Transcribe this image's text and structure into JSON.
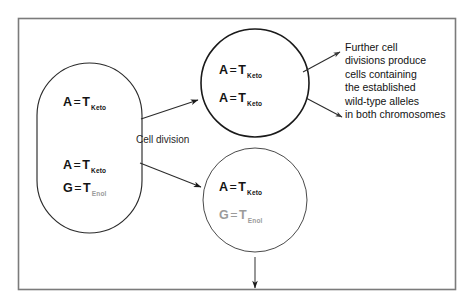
{
  "figure": {
    "border_color": "#7a7a7a",
    "stroke_color": "#1a1a1a",
    "gray_color": "#9b9b9b",
    "background": "#ffffff"
  },
  "parent_cell": {
    "name": "parent-cell",
    "shape": "stadium",
    "top_pair": {
      "left_base": "A",
      "equals": "=",
      "right_base": "T",
      "subscript": "Keto",
      "style": "dark"
    },
    "bottom_pairs": [
      {
        "left_base": "A",
        "equals": "=",
        "right_base": "T",
        "subscript": "Keto",
        "style": "dark"
      },
      {
        "left_base": "G",
        "equals": "=",
        "right_base": "T",
        "subscript": "Enol",
        "style": "dark-with-gray-subscript"
      }
    ]
  },
  "daughter_cell_top": {
    "name": "daughter-cell-top",
    "shape": "circle",
    "pairs": [
      {
        "left_base": "A",
        "equals": "=",
        "right_base": "T",
        "subscript": "Keto",
        "style": "dark"
      },
      {
        "left_base": "A",
        "equals": "=",
        "right_base": "T",
        "subscript": "Keto",
        "style": "dark"
      }
    ]
  },
  "daughter_cell_bottom": {
    "name": "daughter-cell-bottom",
    "shape": "circle",
    "pairs": [
      {
        "left_base": "A",
        "equals": "=",
        "right_base": "T",
        "subscript": "Keto",
        "style": "dark"
      },
      {
        "left_base": "G",
        "equals": "=",
        "right_base": "T",
        "subscript": "Enol",
        "style": "gray"
      }
    ]
  },
  "labels": {
    "cell_division": "Cell division"
  },
  "annotation": {
    "name": "further-divisions-note",
    "lines": [
      "Further cell",
      "divisions produce",
      "cells containing",
      "the established",
      "wild-type alleles",
      "in both chromosomes"
    ]
  },
  "arrows": [
    {
      "name": "arrow-parent-to-top",
      "from": "parent-cell",
      "to": "daughter-cell-top"
    },
    {
      "name": "arrow-parent-to-bottom",
      "from": "parent-cell",
      "to": "daughter-cell-bottom"
    },
    {
      "name": "arrow-top-to-note-upper",
      "from": "daughter-cell-top",
      "to": "further-divisions-note"
    },
    {
      "name": "arrow-top-to-note-lower",
      "from": "daughter-cell-top",
      "to": "further-divisions-note"
    },
    {
      "name": "arrow-bottom-continues-down",
      "from": "daughter-cell-bottom",
      "to": "next-generation"
    }
  ]
}
